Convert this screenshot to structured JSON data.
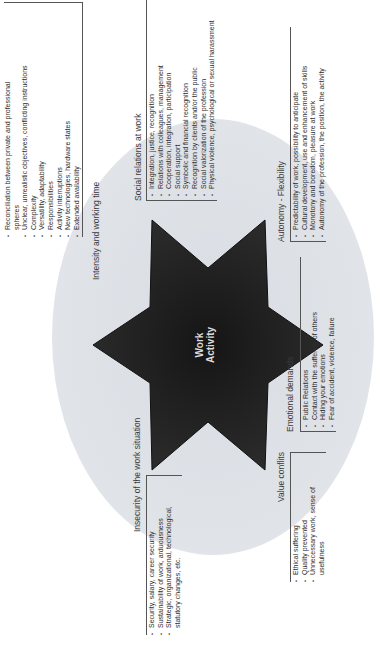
{
  "center": {
    "line1": "Work",
    "line2": "Activity",
    "star_color": "#1f1f1f",
    "ellipse_color": "#dfe2e7"
  },
  "categories": [
    {
      "title": "Intensity and working time",
      "items": [
        "Reconciliation between private and professional spheres",
        "Unclear, unrealistic objectives, conflicting instructions",
        "Complexity",
        "Versatility, adaptability",
        "Responsibilities",
        "Activity interruptions",
        "New technologies, hardware states",
        "Extended availability"
      ]
    },
    {
      "title": "Social relations at work",
      "items": [
        "Integration, justice, recognition",
        "Relations with colleagues, management",
        "Cooperation, integration, participation",
        "Social support",
        "Symbolic and financial recognition",
        "Recognition by clients and/or the public",
        "Social valorization of the profession",
        "Physical violence, psychological or sexual harassment"
      ]
    },
    {
      "title": "Autonomy - Flexibility",
      "items": [
        "Predictability of work, possibility to anticipate",
        "Cultural development, use and enhancement of skills",
        "Monotony and boredom, pleasure at work",
        "Autonomy of the profession, the position, the activity"
      ]
    },
    {
      "title": "Emotional demands",
      "items": [
        "Public Relations",
        "Contact with the suffering of others",
        "Hiding your emotions",
        "Fear of accident, violence, failure"
      ]
    },
    {
      "title": "Value conflits",
      "items": [
        "Ethical suffering",
        "Quality prevented",
        "Unnecessary work, sense of usefulness"
      ]
    },
    {
      "title": "Insecurity of the work situation",
      "items": [
        "Security, salary, career security",
        "Sustainability of work, arduousness",
        "Strategic, organizational, technological, statutory changes, etc."
      ]
    }
  ]
}
